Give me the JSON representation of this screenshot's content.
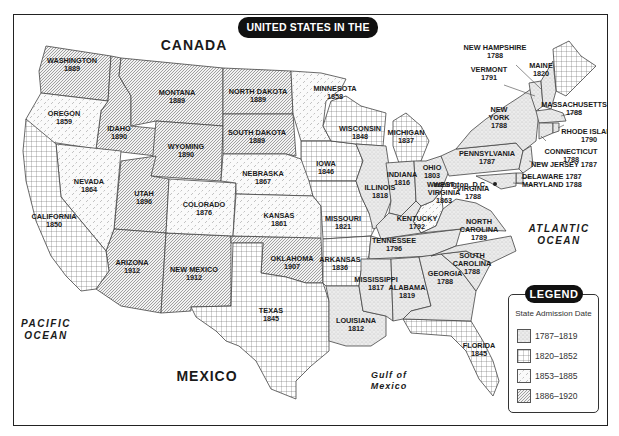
{
  "title": "UNITED STATES IN THE 1920s",
  "regions": {
    "canada": "CANADA",
    "mexico": "MEXICO",
    "pacific_ocean_line1": "PACIFIC",
    "pacific_ocean_line2": "OCEAN",
    "atlantic_ocean_line1": "ATLANTIC",
    "atlantic_ocean_line2": "OCEAN",
    "gulf_line1": "Gulf of",
    "gulf_line2": "Mexico"
  },
  "capital_label": "Washington, D.C.",
  "legend": {
    "title": "LEGEND",
    "subtitle": "State Admission Date",
    "items": [
      {
        "label": "1787–1819",
        "pattern": "stipple"
      },
      {
        "label": "1820–1852",
        "pattern": "grid"
      },
      {
        "label": "1853–1885",
        "pattern": "dashed-diagonal"
      },
      {
        "label": "1886–1920",
        "pattern": "diagonal-hatch"
      }
    ]
  },
  "states": [
    {
      "name": "WASHINGTON",
      "year": "1889",
      "period": "1886–1920"
    },
    {
      "name": "OREGON",
      "year": "1859",
      "period": "1853–1885"
    },
    {
      "name": "CALIFORNIA",
      "year": "1850",
      "period": "1820–1852"
    },
    {
      "name": "NEVADA",
      "year": "1864",
      "period": "1853–1885"
    },
    {
      "name": "IDAHO",
      "year": "1890",
      "period": "1886–1920"
    },
    {
      "name": "MONTANA",
      "year": "1889",
      "period": "1886–1920"
    },
    {
      "name": "WYOMING",
      "year": "1890",
      "period": "1886–1920"
    },
    {
      "name": "UTAH",
      "year": "1896",
      "period": "1886–1920"
    },
    {
      "name": "COLORADO",
      "year": "1876",
      "period": "1853–1885"
    },
    {
      "name": "ARIZONA",
      "year": "1912",
      "period": "1886–1920"
    },
    {
      "name": "NEW MEXICO",
      "year": "1912",
      "period": "1886–1920"
    },
    {
      "name": "NORTH DAKOTA",
      "year": "1889",
      "period": "1886–1920"
    },
    {
      "name": "SOUTH DAKOTA",
      "year": "1889",
      "period": "1886–1920"
    },
    {
      "name": "NEBRASKA",
      "year": "1867",
      "period": "1853–1885"
    },
    {
      "name": "KANSAS",
      "year": "1861",
      "period": "1853–1885"
    },
    {
      "name": "OKLAHOMA",
      "year": "1907",
      "period": "1886–1920"
    },
    {
      "name": "TEXAS",
      "year": "1845",
      "period": "1820–1852"
    },
    {
      "name": "MINNESOTA",
      "year": "1858",
      "period": "1853–1885"
    },
    {
      "name": "IOWA",
      "year": "1846",
      "period": "1820–1852"
    },
    {
      "name": "MISSOURI",
      "year": "1821",
      "period": "1820–1852"
    },
    {
      "name": "ARKANSAS",
      "year": "1836",
      "period": "1820–1852"
    },
    {
      "name": "LOUISIANA",
      "year": "1812",
      "period": "1787–1819"
    },
    {
      "name": "WISCONSIN",
      "year": "1848",
      "period": "1820–1852"
    },
    {
      "name": "MICHIGAN",
      "year": "1837",
      "period": "1820–1852"
    },
    {
      "name": "ILLINOIS",
      "year": "1818",
      "period": "1787–1819"
    },
    {
      "name": "INDIANA",
      "year": "1816",
      "period": "1787–1819"
    },
    {
      "name": "OHIO",
      "year": "1803",
      "period": "1787–1819"
    },
    {
      "name": "KENTUCKY",
      "year": "1792",
      "period": "1787–1819"
    },
    {
      "name": "TENNESSEE",
      "year": "1796",
      "period": "1787–1819"
    },
    {
      "name": "MISSISSIPPI",
      "year": "1817",
      "period": "1787–1819"
    },
    {
      "name": "ALABAMA",
      "year": "1819",
      "period": "1787–1819"
    },
    {
      "name": "GEORGIA",
      "year": "1788",
      "period": "1787–1819"
    },
    {
      "name": "FLORIDA",
      "year": "1845",
      "period": "1820–1852"
    },
    {
      "name": "SOUTH CAROLINA",
      "year": "1788",
      "period": "1787–1819"
    },
    {
      "name": "NORTH CAROLINA",
      "year": "1789",
      "period": "1787–1819"
    },
    {
      "name": "VIRGINIA",
      "year": "1788",
      "period": "1787–1819"
    },
    {
      "name": "WEST VIRGINIA",
      "year": "1863",
      "period": "1853–1885"
    },
    {
      "name": "PENNSYLVANIA",
      "year": "1787",
      "period": "1787–1819"
    },
    {
      "name": "NEW YORK",
      "year": "1788",
      "period": "1787–1819"
    },
    {
      "name": "VERMONT",
      "year": "1791",
      "period": "1787–1819"
    },
    {
      "name": "NEW HAMPSHIRE",
      "year": "1788",
      "period": "1787–1819"
    },
    {
      "name": "MAINE",
      "year": "1820",
      "period": "1820–1852"
    },
    {
      "name": "MASSACHUSETTS",
      "year": "1788",
      "period": "1787–1819"
    },
    {
      "name": "RHODE ISLAND",
      "year": "1790",
      "period": "1787–1819"
    },
    {
      "name": "CONNECTICUT",
      "year": "1788",
      "period": "1787–1819"
    },
    {
      "name": "NEW JERSEY",
      "year": "1787",
      "period": "1787–1819"
    },
    {
      "name": "DELAWARE",
      "year": "1787",
      "period": "1787–1819"
    },
    {
      "name": "MARYLAND",
      "year": "1788",
      "period": "1787–1819"
    }
  ],
  "colors": {
    "ink": "#1a1a1a",
    "pill_bg": "#111111",
    "pill_text": "#ffffff",
    "stipple_fill": "#e6e6e6",
    "hatch_line": "#555555"
  }
}
